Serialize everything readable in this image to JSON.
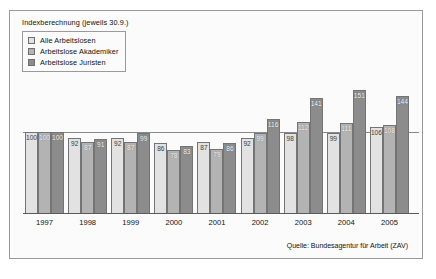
{
  "chart_data": {
    "type": "bar",
    "title": "Indexberechnung (jeweils 30.9.)",
    "xlabel": "",
    "ylabel": "",
    "ylim": [
      0,
      160
    ],
    "grid": false,
    "legend_position": "top-left",
    "reference_line": 100,
    "categories": [
      "1997",
      "1998",
      "1999",
      "2000",
      "2001",
      "2002",
      "2003",
      "2004",
      "2005"
    ],
    "series": [
      {
        "name": "Alle Arbeitslosen",
        "color": "#e2e2e2",
        "values": [
          100,
          92,
          92,
          86,
          87,
          92,
          98,
          99,
          106
        ]
      },
      {
        "name": "Arbeitslose Akademiker",
        "color": "#b3b3b3",
        "values": [
          100,
          87,
          87,
          78,
          79,
          99,
          112,
          111,
          108
        ]
      },
      {
        "name": "Arbeitslose Juristen",
        "color": "#8c8c8c",
        "values": [
          100,
          91,
          99,
          83,
          86,
          116,
          141,
          151,
          144
        ]
      }
    ],
    "source": "Quelle: Bundesagentur für Arbeit (ZAV)"
  }
}
